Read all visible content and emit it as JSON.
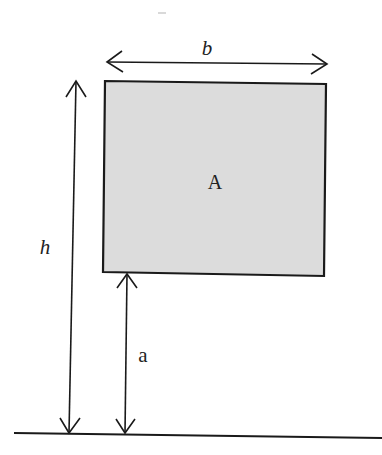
{
  "diagram": {
    "box_label": "A",
    "width_label": "b",
    "height_label": "h",
    "offset_label": "a",
    "colors": {
      "box_fill": "#dcdcdc",
      "stroke": "#1a1a1a",
      "background": "#ffffff"
    }
  }
}
